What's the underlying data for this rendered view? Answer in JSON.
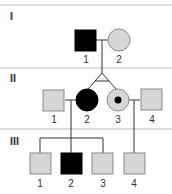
{
  "colors": {
    "affected": "#000000",
    "unaffected": "#d6d6d6",
    "outline": "#8a8a8a",
    "line": "#333333",
    "divider": "#bdbdbd",
    "carrier_dot": "#000000"
  },
  "generations": [
    {
      "label": "I",
      "divider_y": 5
    },
    {
      "label": "II",
      "divider_y": 68
    },
    {
      "label": "III",
      "divider_y": 129
    }
  ],
  "individuals": [
    {
      "id": "I-1",
      "number": "1",
      "sex": "male",
      "status": "affected"
    },
    {
      "id": "I-2",
      "number": "2",
      "sex": "female",
      "status": "unaffected"
    },
    {
      "id": "II-1",
      "number": "1",
      "sex": "male",
      "status": "unaffected"
    },
    {
      "id": "II-2",
      "number": "2",
      "sex": "female",
      "status": "affected",
      "twin": "monozygotic"
    },
    {
      "id": "II-3",
      "number": "3",
      "sex": "female",
      "status": "carrier",
      "twin": "monozygotic"
    },
    {
      "id": "II-4",
      "number": "4",
      "sex": "male",
      "status": "unaffected"
    },
    {
      "id": "III-1",
      "number": "1",
      "sex": "male",
      "status": "unaffected"
    },
    {
      "id": "III-2",
      "number": "2",
      "sex": "male",
      "status": "affected"
    },
    {
      "id": "III-3",
      "number": "3",
      "sex": "male",
      "status": "unaffected"
    },
    {
      "id": "III-4",
      "number": "4",
      "sex": "male",
      "status": "unaffected"
    }
  ],
  "relationships": [
    {
      "type": "mating",
      "partners": [
        "I-1",
        "I-2"
      ],
      "children": [
        "II-2",
        "II-3"
      ],
      "twins": "monozygotic"
    },
    {
      "type": "mating",
      "partners": [
        "II-1",
        "II-2"
      ],
      "children": [
        "III-1",
        "III-2",
        "III-3"
      ]
    },
    {
      "type": "mating",
      "partners": [
        "II-3",
        "II-4"
      ],
      "children": [
        "III-4"
      ]
    }
  ]
}
